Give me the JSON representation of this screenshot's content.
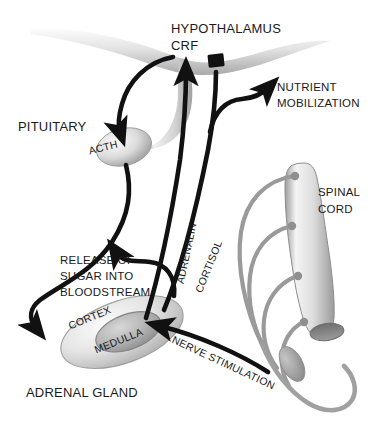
{
  "diagram": {
    "background_color": "#ffffff",
    "ink_color": "#111111",
    "tissue_color": "#c8c8c8",
    "nerve_color": "#9a9a9a"
  },
  "labels": {
    "hypothalamus": "HYPOTHALAMUS",
    "crf": "CRF",
    "pituitary": "PITUITARY",
    "acth": "ACTH",
    "nutrient_line1": "NUTRIENT",
    "nutrient_line2": "MOBILIZATION",
    "spinal_line1": "SPINAL",
    "spinal_line2": "CORD",
    "adrenalin": "ADRENALIN",
    "cortisol": "CORTISOL",
    "release_line1": "RELEASE OF",
    "release_line2": "SUGAR INTO",
    "release_line3": "BLOODSTREAM",
    "cortex": "CORTEX",
    "medulla": "MEDULLA",
    "nerve_stimulation": "NERVE STIMULATION",
    "adrenal_gland": "ADRENAL GLAND"
  },
  "anatomy": {
    "brain_base": "brain-base-silhouette",
    "pituitary_stalk": "infundibulum-stalk",
    "pituitary_gland": "pituitary-oval",
    "adrenal_cortex": "adrenal-cortex-ellipse",
    "adrenal_medulla": "adrenal-medulla-ellipse",
    "spinal_cord": "spinal-cord-cylinder",
    "spinal_cord_cut_face": "spinal-cord-cut-end",
    "nerve_roots_count": 4,
    "ganglion": "sympathetic-ganglion"
  },
  "pathways": [
    {
      "name": "crf-to-pituitary",
      "from": "HYPOTHALAMUS CRF",
      "to": "PITUITARY ACTH",
      "style": "arrow",
      "color": "#111111"
    },
    {
      "name": "acth-to-adrenal-cortex",
      "from": "PITUITARY ACTH",
      "to": "ADRENAL CORTEX",
      "style": "arrow",
      "color": "#111111"
    },
    {
      "name": "cortisol-to-hypothalamus",
      "from": "ADRENAL CORTEX",
      "to": "HYPOTHALAMUS",
      "style": "inhibition",
      "label": "CORTISOL",
      "color": "#111111"
    },
    {
      "name": "adrenalin-to-hypothalamus",
      "from": "ADRENAL MEDULLA",
      "to": "HYPOTHALAMUS",
      "style": "arrow",
      "label": "ADRENALIN",
      "color": "#111111"
    },
    {
      "name": "cortisol-to-nutrient-mobilization",
      "from": "CORTISOL",
      "to": "NUTRIENT MOBILIZATION",
      "style": "arrow",
      "color": "#111111"
    },
    {
      "name": "adrenalin-to-sugar-release",
      "from": "ADRENALIN",
      "to": "RELEASE OF SUGAR INTO BLOODSTREAM",
      "style": "arrow",
      "color": "#111111"
    },
    {
      "name": "nerve-stimulation-to-medulla",
      "from": "SPINAL CORD",
      "to": "ADRENAL MEDULLA",
      "style": "arrow",
      "label": "NERVE STIMULATION",
      "color": "#111111"
    }
  ]
}
